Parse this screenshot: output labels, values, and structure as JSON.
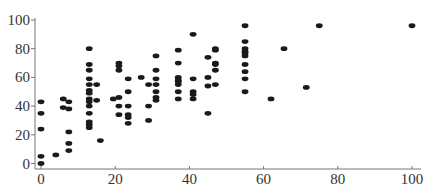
{
  "chart_data": {
    "type": "scatter",
    "title": "",
    "xlabel": "",
    "ylabel": "",
    "xlim": [
      0,
      100
    ],
    "ylim": [
      0,
      100
    ],
    "grid": false,
    "legend": null,
    "x_ticks": [
      "0",
      "20",
      "40",
      "60",
      "80",
      "100"
    ],
    "y_ticks": [
      "0",
      "20",
      "40",
      "60",
      "80",
      "100"
    ],
    "marker_color": "#1a1a1a",
    "points": [
      [
        0,
        43
      ],
      [
        0,
        35
      ],
      [
        0,
        24
      ],
      [
        0,
        5
      ],
      [
        0,
        0
      ],
      [
        4,
        6
      ],
      [
        6,
        45
      ],
      [
        6,
        39
      ],
      [
        7.5,
        43
      ],
      [
        7.5,
        38
      ],
      [
        7.5,
        22
      ],
      [
        7.5,
        14
      ],
      [
        7.5,
        9
      ],
      [
        13,
        80
      ],
      [
        13,
        69
      ],
      [
        13,
        65
      ],
      [
        13,
        59
      ],
      [
        13,
        55
      ],
      [
        13,
        51
      ],
      [
        13,
        49
      ],
      [
        13,
        45
      ],
      [
        13,
        43
      ],
      [
        13,
        40
      ],
      [
        13,
        35
      ],
      [
        13,
        29
      ],
      [
        13,
        27
      ],
      [
        13,
        25
      ],
      [
        15,
        55
      ],
      [
        15,
        44
      ],
      [
        16,
        16
      ],
      [
        19.5,
        45
      ],
      [
        21,
        70
      ],
      [
        21,
        68
      ],
      [
        21,
        65
      ],
      [
        21,
        46
      ],
      [
        21,
        40
      ],
      [
        21,
        34
      ],
      [
        23.5,
        59
      ],
      [
        23.5,
        50
      ],
      [
        23.5,
        40
      ],
      [
        23.5,
        34
      ],
      [
        23.5,
        32
      ],
      [
        23.5,
        28
      ],
      [
        27,
        60
      ],
      [
        29,
        55
      ],
      [
        29,
        40
      ],
      [
        29,
        30
      ],
      [
        31,
        75
      ],
      [
        31,
        65
      ],
      [
        31,
        59
      ],
      [
        31,
        55
      ],
      [
        31,
        50
      ],
      [
        31,
        46
      ],
      [
        31,
        44
      ],
      [
        37,
        79
      ],
      [
        37,
        70
      ],
      [
        37,
        60
      ],
      [
        37,
        58
      ],
      [
        37,
        57
      ],
      [
        37,
        55
      ],
      [
        37,
        50
      ],
      [
        37,
        45
      ],
      [
        41,
        90
      ],
      [
        41,
        59
      ],
      [
        41,
        50
      ],
      [
        41,
        48
      ],
      [
        41,
        45
      ],
      [
        45,
        74
      ],
      [
        45,
        60
      ],
      [
        45,
        54
      ],
      [
        45,
        35
      ],
      [
        47,
        80
      ],
      [
        47,
        79
      ],
      [
        47,
        70
      ],
      [
        47,
        69
      ],
      [
        47,
        65
      ],
      [
        47,
        55
      ],
      [
        55,
        96
      ],
      [
        55,
        85
      ],
      [
        55,
        80
      ],
      [
        55,
        78
      ],
      [
        55,
        77
      ],
      [
        55,
        75
      ],
      [
        55,
        69
      ],
      [
        55,
        64
      ],
      [
        55,
        59
      ],
      [
        55,
        50
      ],
      [
        62,
        45
      ],
      [
        65.5,
        80
      ],
      [
        71.5,
        53
      ],
      [
        75,
        96
      ],
      [
        100,
        96
      ]
    ]
  }
}
